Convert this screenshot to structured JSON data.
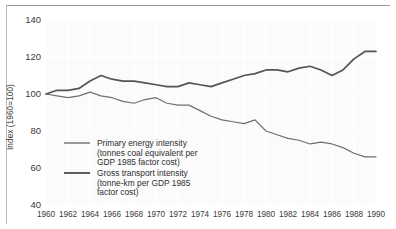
{
  "chart_data": {
    "type": "line",
    "title": "",
    "subtitle": "",
    "xlabel": "",
    "ylabel": "Index (1960=100)",
    "xlim": [
      1960,
      1990
    ],
    "ylim": [
      40,
      140
    ],
    "grid": true,
    "legend_position": "inside-lower-left",
    "x": [
      1960,
      1961,
      1962,
      1963,
      1964,
      1965,
      1966,
      1967,
      1968,
      1969,
      1970,
      1971,
      1972,
      1973,
      1974,
      1975,
      1976,
      1977,
      1978,
      1979,
      1980,
      1981,
      1982,
      1983,
      1984,
      1985,
      1986,
      1987,
      1988,
      1989,
      1990
    ],
    "xticks": [
      1960,
      1962,
      1964,
      1966,
      1968,
      1970,
      1972,
      1974,
      1976,
      1978,
      1980,
      1982,
      1984,
      1986,
      1988,
      1990
    ],
    "xtick_labels": [
      "1960",
      "1962",
      "1964",
      "1966",
      "1968",
      "1970",
      "1972",
      "1974",
      "1976",
      "1978",
      "1980",
      "1982",
      "1984",
      "1986",
      "1988",
      "1990"
    ],
    "yticks": [
      40,
      60,
      80,
      100,
      120,
      140
    ],
    "ytick_labels": [
      "40",
      "60",
      "80",
      "100",
      "120",
      "140"
    ],
    "series": [
      {
        "name": "Primary energy intensity",
        "name_detail": "(tonnes coal equivalent per GDP 1985 factor cost)",
        "color": "#6f6f6f",
        "width": 1.2,
        "values": [
          100,
          99,
          98,
          99,
          101,
          99,
          98,
          96,
          95,
          97,
          98,
          95,
          94,
          94,
          91,
          88,
          86,
          85,
          84,
          86,
          80,
          78,
          76,
          75,
          73,
          74,
          73,
          71,
          68,
          66,
          66
        ]
      },
      {
        "name": "Gross transport intensity",
        "name_detail": "(tonne-km per GDP 1985 factor cost)",
        "color": "#555555",
        "width": 1.7,
        "values": [
          100,
          102,
          102,
          103,
          107,
          110,
          108,
          107,
          107,
          106,
          105,
          104,
          104,
          106,
          105,
          104,
          106,
          108,
          110,
          111,
          113,
          113,
          112,
          114,
          115,
          113,
          110,
          113,
          119,
          123,
          123
        ]
      }
    ]
  },
  "axis": {
    "y_label": "Index (1960=100)"
  },
  "legend": {
    "items": [
      {
        "label_line1": "Primary energy intensity",
        "label_line2": "(tonnes coal equivalent per",
        "label_line3": "GDP 1985 factor cost)"
      },
      {
        "label_line1": "Gross transport intensity",
        "label_line2": "(tonne-km per GDP 1985",
        "label_line3": "factor cost)"
      }
    ]
  }
}
